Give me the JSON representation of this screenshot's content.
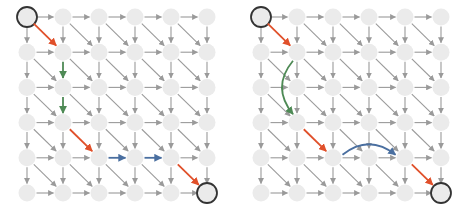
{
  "figure": {
    "width": 466,
    "height": 210,
    "colors": {
      "node_fill": "#ebebeb",
      "node_stroke_highlight": "#333333",
      "edge_default": "#9a9a9a",
      "diagonal_path": "#e0502a",
      "vertical_path": "#4e8a55",
      "horizontal_path": "#4a6fa0"
    },
    "grid": {
      "rows": 6,
      "cols": 6,
      "col_spacing": 36,
      "row_spacing": 35.2,
      "node_radius": 8.5
    },
    "panels": [
      {
        "name": "left-panel",
        "origin": [
          27,
          17
        ],
        "start_node": [
          0,
          0
        ],
        "end_node": [
          5,
          5
        ],
        "path_edges": [
          {
            "from": [
              0,
              0
            ],
            "to": [
              1,
              1
            ],
            "kind": "diagonal",
            "style": "straight"
          },
          {
            "from": [
              1,
              1
            ],
            "to": [
              2,
              1
            ],
            "kind": "vertical",
            "style": "straight"
          },
          {
            "from": [
              2,
              1
            ],
            "to": [
              3,
              1
            ],
            "kind": "vertical",
            "style": "straight"
          },
          {
            "from": [
              3,
              1
            ],
            "to": [
              4,
              2
            ],
            "kind": "diagonal",
            "style": "straight"
          },
          {
            "from": [
              4,
              2
            ],
            "to": [
              4,
              3
            ],
            "kind": "horizontal",
            "style": "straight"
          },
          {
            "from": [
              4,
              3
            ],
            "to": [
              4,
              4
            ],
            "kind": "horizontal",
            "style": "straight"
          },
          {
            "from": [
              4,
              4
            ],
            "to": [
              5,
              5
            ],
            "kind": "diagonal",
            "style": "straight"
          }
        ]
      },
      {
        "name": "right-panel",
        "origin": [
          261,
          17
        ],
        "start_node": [
          0,
          0
        ],
        "end_node": [
          5,
          5
        ],
        "path_edges": [
          {
            "from": [
              0,
              0
            ],
            "to": [
              1,
              1
            ],
            "kind": "diagonal",
            "style": "straight"
          },
          {
            "from": [
              1,
              1
            ],
            "to": [
              3,
              1
            ],
            "kind": "vertical",
            "style": "curve",
            "bulge": -13
          },
          {
            "from": [
              3,
              1
            ],
            "to": [
              4,
              2
            ],
            "kind": "diagonal",
            "style": "straight"
          },
          {
            "from": [
              4,
              2
            ],
            "to": [
              4,
              4
            ],
            "kind": "horizontal",
            "style": "curve",
            "bulge": -12
          },
          {
            "from": [
              4,
              4
            ],
            "to": [
              5,
              5
            ],
            "kind": "diagonal",
            "style": "straight"
          }
        ]
      }
    ]
  }
}
